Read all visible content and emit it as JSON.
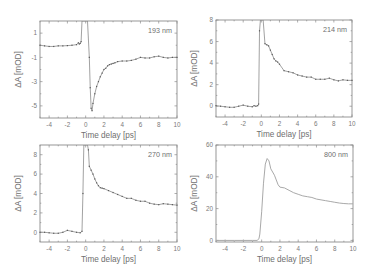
{
  "figure": {
    "width": 371,
    "height": 280,
    "trace_color": "#8a8a8a",
    "frame_color": "#8c8c8c",
    "text_color": "#6f6f6f"
  },
  "chart_data": [
    {
      "type": "line",
      "panel_label": "193 nm",
      "xlabel": "Time delay [ps]",
      "ylabel": "ΔA [mOD]",
      "xlim": [
        -5,
        10
      ],
      "ylim": [
        -6,
        2
      ],
      "xticks": [
        -4,
        -2,
        0,
        2,
        4,
        6,
        8,
        10
      ],
      "yticks": [
        1,
        -1,
        -3,
        -5
      ],
      "grid": false,
      "frame": {
        "x": 40,
        "y": 21,
        "w": 137,
        "h": 97
      },
      "x": [
        -5,
        -4.5,
        -4,
        -3.5,
        -3,
        -2.5,
        -2,
        -1.5,
        -1,
        -0.8,
        -0.7,
        -0.6,
        -0.5,
        -0.4,
        -0.3,
        0.0,
        0.2,
        0.4,
        0.5,
        0.6,
        0.7,
        0.8,
        1.0,
        1.2,
        1.4,
        1.6,
        1.8,
        2.0,
        2.2,
        2.4,
        2.6,
        2.8,
        3.0,
        3.2,
        3.5,
        4.0,
        4.5,
        5.0,
        5.5,
        6.0,
        6.5,
        7.0,
        7.5,
        8.0,
        8.5,
        9.0,
        9.5,
        10.0
      ],
      "values": [
        0.0,
        -0.05,
        -0.1,
        -0.1,
        -0.05,
        -0.05,
        -0.03,
        0.0,
        0.05,
        0.2,
        0.1,
        0.15,
        0.3,
        2.0,
        2.0,
        2.0,
        2.0,
        -1.0,
        -3.5,
        -5.2,
        -5.4,
        -4.8,
        -4.0,
        -3.4,
        -3.0,
        -2.6,
        -2.3,
        -2.0,
        -1.9,
        -1.7,
        -1.6,
        -1.55,
        -1.5,
        -1.45,
        -1.35,
        -1.3,
        -1.3,
        -1.25,
        -1.15,
        -1.0,
        -1.05,
        -1.05,
        -0.95,
        -0.9,
        -1.0,
        -1.05,
        -1.0,
        -1.0
      ]
    },
    {
      "type": "line",
      "panel_label": "214 nm",
      "xlabel": "Time delay [ps]",
      "ylabel": "ΔA [mOD]",
      "xlim": [
        -5,
        10
      ],
      "ylim": [
        -1,
        8
      ],
      "xticks": [
        -4,
        -2,
        0,
        2,
        4,
        6,
        8,
        10
      ],
      "yticks": [
        0,
        2,
        4,
        6,
        8
      ],
      "grid": false,
      "frame": {
        "x": 216,
        "y": 20,
        "w": 136,
        "h": 97
      },
      "x": [
        -5,
        -4.5,
        -4,
        -3.5,
        -3,
        -2.5,
        -2,
        -1.5,
        -1,
        -0.8,
        -0.6,
        -0.4,
        -0.3,
        -0.2,
        -0.1,
        0.0,
        0.2,
        0.4,
        0.6,
        0.8,
        1.0,
        1.2,
        1.4,
        1.6,
        1.8,
        2.0,
        2.5,
        3.0,
        3.5,
        4.0,
        4.5,
        5.0,
        5.5,
        6.0,
        6.5,
        7.0,
        7.5,
        8.0,
        8.5,
        9.0,
        9.5,
        10.0
      ],
      "values": [
        0.05,
        0.0,
        -0.05,
        -0.1,
        -0.1,
        0.0,
        0.1,
        0.0,
        -0.05,
        0.05,
        0.0,
        0.05,
        0.2,
        7.0,
        8.0,
        8.0,
        8.0,
        5.8,
        5.7,
        5.6,
        5.2,
        4.8,
        4.4,
        4.2,
        4.1,
        3.9,
        3.3,
        3.2,
        3.1,
        2.9,
        2.8,
        2.7,
        2.7,
        2.5,
        2.5,
        2.5,
        2.6,
        2.45,
        2.35,
        2.45,
        2.4,
        2.4
      ]
    },
    {
      "type": "line",
      "panel_label": "270 nm",
      "xlabel": "Time delay [ps]",
      "ylabel": "ΔA [mOD]",
      "xlim": [
        -5,
        10
      ],
      "ylim": [
        -1,
        9
      ],
      "xticks": [
        -4,
        -2,
        0,
        2,
        4,
        6,
        8,
        10
      ],
      "yticks": [
        0,
        2,
        4,
        6,
        8
      ],
      "grid": false,
      "frame": {
        "x": 40,
        "y": 145,
        "w": 137,
        "h": 97
      },
      "x": [
        -5,
        -4.5,
        -4,
        -3.5,
        -3,
        -2.5,
        -2,
        -1.5,
        -1,
        -0.6,
        -0.4,
        -0.3,
        -0.2,
        0.0,
        0.2,
        0.3,
        0.4,
        0.6,
        0.8,
        1.0,
        1.2,
        1.4,
        1.6,
        1.8,
        2.0,
        2.5,
        3.0,
        3.5,
        4.0,
        4.5,
        5.0,
        5.5,
        6.0,
        6.5,
        7.0,
        7.5,
        8.0,
        8.5,
        9.0,
        9.5,
        10.0
      ],
      "values": [
        0.0,
        0.0,
        -0.05,
        -0.1,
        -0.1,
        0.0,
        0.2,
        0.1,
        0.0,
        -0.05,
        0.1,
        4.0,
        9.0,
        9.0,
        9.0,
        8.5,
        6.8,
        6.4,
        6.0,
        5.5,
        5.1,
        4.8,
        4.6,
        4.55,
        4.5,
        4.3,
        4.1,
        3.9,
        3.7,
        3.5,
        3.5,
        3.3,
        3.2,
        3.2,
        3.0,
        2.9,
        2.85,
        2.95,
        2.9,
        2.85,
        2.8
      ]
    },
    {
      "type": "line",
      "panel_label": "800 nm",
      "xlabel": "Time delay [ps]",
      "ylabel": "ΔA [mOD]",
      "xlim": [
        -5,
        10
      ],
      "ylim": [
        -1,
        60
      ],
      "xticks": [
        -4,
        -2,
        0,
        2,
        4,
        6,
        8,
        10
      ],
      "yticks": [
        0,
        20,
        40,
        60
      ],
      "grid": false,
      "frame": {
        "x": 216,
        "y": 145,
        "w": 137,
        "h": 97
      },
      "x": [
        -5,
        -4,
        -3,
        -2,
        -1,
        -0.5,
        -0.3,
        -0.2,
        0.0,
        0.2,
        0.4,
        0.6,
        0.8,
        1.0,
        1.2,
        1.4,
        1.6,
        1.8,
        2.0,
        2.5,
        3.0,
        3.5,
        4.0,
        4.5,
        5.0,
        5.5,
        6.0,
        6.5,
        7.0,
        7.5,
        8.0,
        8.5,
        9.0,
        9.5,
        10.0
      ],
      "values": [
        0.0,
        0.0,
        0.0,
        0.0,
        0.0,
        0.0,
        1.0,
        4.0,
        18.0,
        36.0,
        48.0,
        51.5,
        50.0,
        45.0,
        43.0,
        41.0,
        38.0,
        35.0,
        33.5,
        33.0,
        31.5,
        30.0,
        29.0,
        28.0,
        27.5,
        27.0,
        26.0,
        25.5,
        25.0,
        24.5,
        24.0,
        23.5,
        23.2,
        23.0,
        23.0
      ]
    }
  ]
}
